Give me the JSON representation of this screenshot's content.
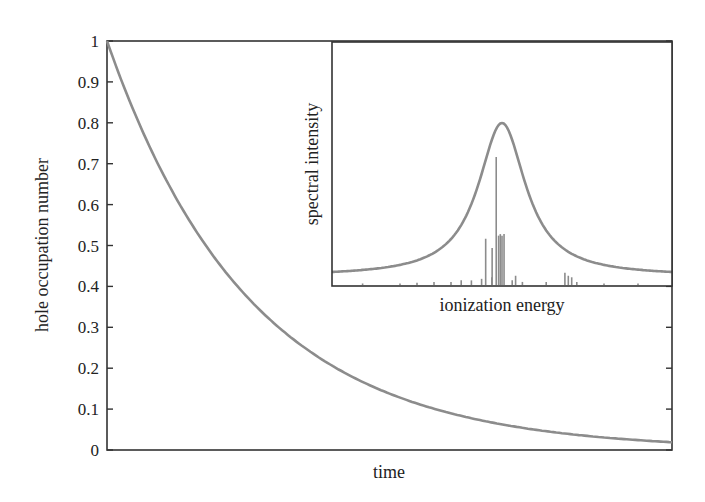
{
  "chart_data": [
    {
      "type": "line",
      "title": "",
      "xlabel": "time",
      "ylabel": "hole occupation number",
      "ylim": [
        0,
        1
      ],
      "yticks": [
        "0",
        "0.1",
        "0.2",
        "0.3",
        "0.4",
        "0.5",
        "0.6",
        "0.7",
        "0.8",
        "0.9",
        "1"
      ],
      "xticks": [],
      "grid": false,
      "legend": null,
      "x": [
        0.0,
        0.1,
        0.2,
        0.3,
        0.4,
        0.5,
        0.6,
        0.7,
        0.8,
        0.9,
        1.0
      ],
      "series": [
        {
          "name": "hole occupation number",
          "values": [
            1.0,
            0.67,
            0.45,
            0.31,
            0.21,
            0.14,
            0.093,
            0.063,
            0.042,
            0.029,
            0.019
          ]
        }
      ],
      "color": "#8c8c8c"
    },
    {
      "type": "line",
      "role": "inset",
      "title": "",
      "xlabel": "ionization energy",
      "ylabel": "spectral intensity",
      "xticks": [],
      "yticks": [],
      "grid": false,
      "envelope": {
        "shape": "lorentzian",
        "center": 0.5,
        "peak": 1.0,
        "baseline": 0.03
      },
      "sticks": [
        {
          "x": 0.09,
          "h": 0.01
        },
        {
          "x": 0.2,
          "h": 0.01
        },
        {
          "x": 0.25,
          "h": 0.015
        },
        {
          "x": 0.3,
          "h": 0.02
        },
        {
          "x": 0.35,
          "h": 0.02
        },
        {
          "x": 0.38,
          "h": 0.03
        },
        {
          "x": 0.41,
          "h": 0.03
        },
        {
          "x": 0.44,
          "h": 0.04
        },
        {
          "x": 0.452,
          "h": 0.3
        },
        {
          "x": 0.47,
          "h": 0.05
        },
        {
          "x": 0.471,
          "h": 0.24
        },
        {
          "x": 0.483,
          "h": 0.83
        },
        {
          "x": 0.49,
          "h": 0.32
        },
        {
          "x": 0.495,
          "h": 0.33
        },
        {
          "x": 0.5,
          "h": 0.32
        },
        {
          "x": 0.506,
          "h": 0.33
        },
        {
          "x": 0.53,
          "h": 0.03
        },
        {
          "x": 0.54,
          "h": 0.06
        },
        {
          "x": 0.56,
          "h": 0.02
        },
        {
          "x": 0.63,
          "h": 0.02
        },
        {
          "x": 0.685,
          "h": 0.08
        },
        {
          "x": 0.695,
          "h": 0.06
        },
        {
          "x": 0.705,
          "h": 0.05
        },
        {
          "x": 0.72,
          "h": 0.02
        },
        {
          "x": 0.8,
          "h": 0.01
        },
        {
          "x": 0.9,
          "h": 0.01
        }
      ],
      "color": "#8c8c8c"
    }
  ],
  "main": {
    "xlabel": "time",
    "ylabel": "hole occupation number",
    "yticks": [
      "0",
      "0.1",
      "0.2",
      "0.3",
      "0.4",
      "0.5",
      "0.6",
      "0.7",
      "0.8",
      "0.9",
      "1"
    ]
  },
  "inset": {
    "xlabel": "ionization energy",
    "ylabel": "spectral intensity"
  }
}
